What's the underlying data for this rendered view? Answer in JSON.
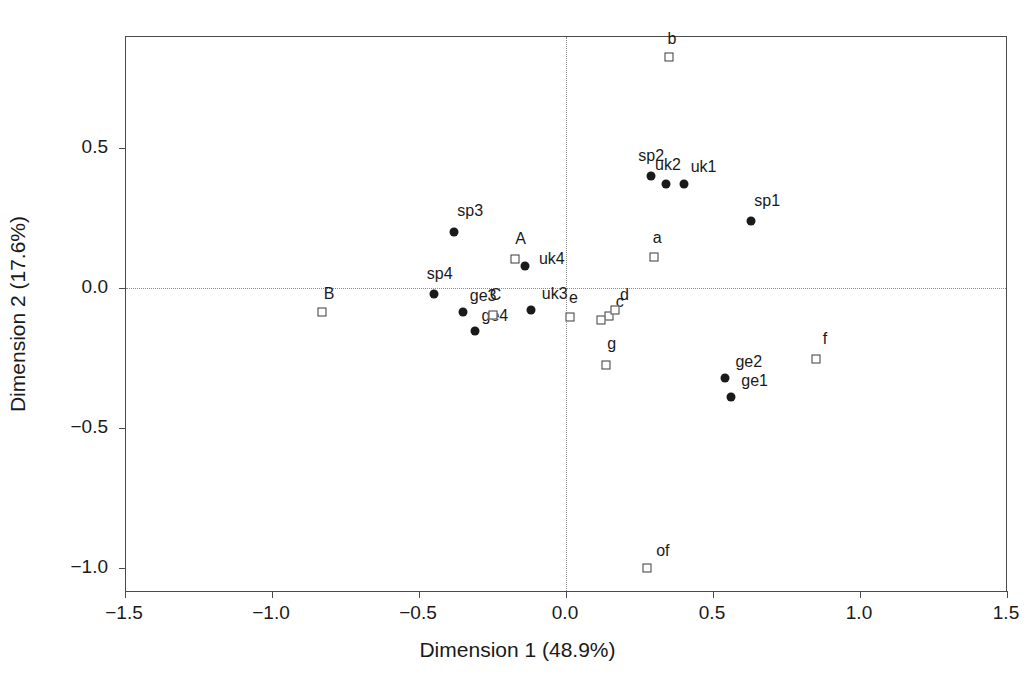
{
  "axes": {
    "xlabel": "Dimension 1 (48.9%)",
    "ylabel": "Dimension 2 (17.6%)",
    "x_ticks": [
      "-1.5",
      "-1.0",
      "-0.5",
      "0.0",
      "0.5",
      "1.0",
      "1.5"
    ],
    "y_ticks": [
      "0.5",
      "0.0",
      "-0.5",
      "-1.0"
    ]
  },
  "chart_data": {
    "type": "scatter",
    "title": "",
    "xlabel": "Dimension 1 (48.9%)",
    "ylabel": "Dimension 2 (17.6%)",
    "xlim": [
      -1.62,
      1.62
    ],
    "ylim": [
      -1.14,
      0.95
    ],
    "xticks": [
      -1.5,
      -1.0,
      -0.5,
      0.0,
      0.5,
      1.0,
      1.5
    ],
    "yticks": [
      0.5,
      0.0,
      -0.5,
      -1.0
    ],
    "grid": "dotted lines at x=0 and y=0",
    "legend": "none",
    "series": [
      {
        "name": "row-points",
        "marker": "filled-circle",
        "color": "#1a1a1a",
        "points": [
          {
            "label": "sp2",
            "x": 0.29,
            "y": 0.4,
            "label_dx": 0,
            "label_dy": -20
          },
          {
            "label": "uk2",
            "x": 0.34,
            "y": 0.37,
            "label_dx": 2,
            "label_dy": -19
          },
          {
            "label": "uk1",
            "x": 0.4,
            "y": 0.37,
            "label_dx": 20,
            "label_dy": -17
          },
          {
            "label": "sp1",
            "x": 0.63,
            "y": 0.24,
            "label_dx": 16,
            "label_dy": -20
          },
          {
            "label": "sp3",
            "x": -0.38,
            "y": 0.2,
            "label_dx": 16,
            "label_dy": -21
          },
          {
            "label": "uk4",
            "x": -0.14,
            "y": 0.08,
            "label_dx": 27,
            "label_dy": -7
          },
          {
            "label": "sp4",
            "x": -0.45,
            "y": -0.02,
            "label_dx": 6,
            "label_dy": -20
          },
          {
            "label": "ge3",
            "x": -0.35,
            "y": -0.085,
            "label_dx": 20,
            "label_dy": -16
          },
          {
            "label": "ge4",
            "x": -0.31,
            "y": -0.155,
            "label_dx": 20,
            "label_dy": -15
          },
          {
            "label": "uk3",
            "x": -0.12,
            "y": -0.08,
            "label_dx": 24,
            "label_dy": -16
          },
          {
            "label": "ge2",
            "x": 0.54,
            "y": -0.32,
            "label_dx": 24,
            "label_dy": -16
          },
          {
            "label": "ge1",
            "x": 0.56,
            "y": -0.39,
            "label_dx": 24,
            "label_dy": -16
          }
        ]
      },
      {
        "name": "column-points",
        "marker": "open-square",
        "color": "#3a3a3a",
        "points": [
          {
            "label": "b",
            "x": 0.35,
            "y": 0.825,
            "label_dx": 3,
            "label_dy": -18
          },
          {
            "label": "a",
            "x": 0.3,
            "y": 0.11,
            "label_dx": 3,
            "label_dy": -19
          },
          {
            "label": "A",
            "x": -0.175,
            "y": 0.105,
            "label_dx": 6,
            "label_dy": -20
          },
          {
            "label": "B",
            "x": -0.83,
            "y": -0.085,
            "label_dx": 7,
            "label_dy": -18
          },
          {
            "label": "C",
            "x": -0.25,
            "y": -0.095,
            "label_dx": 3,
            "label_dy": -20
          },
          {
            "label": "e",
            "x": 0.015,
            "y": -0.105,
            "label_dx": 3,
            "label_dy": -19
          },
          {
            "label": "c",
            "x": 0.145,
            "y": -0.1,
            "label_dx": 11,
            "label_dy": -14
          },
          {
            "label": "d",
            "x": 0.165,
            "y": -0.08,
            "label_dx": 10,
            "label_dy": -15
          },
          {
            "label": "",
            "x": 0.12,
            "y": -0.115,
            "label_dx": 0,
            "label_dy": 0
          },
          {
            "label": "g",
            "x": 0.135,
            "y": -0.275,
            "label_dx": 6,
            "label_dy": -21
          },
          {
            "label": "f",
            "x": 0.85,
            "y": -0.255,
            "label_dx": 9,
            "label_dy": -20
          },
          {
            "label": "of",
            "x": 0.275,
            "y": -1.0,
            "label_dx": 16,
            "label_dy": -17
          }
        ]
      }
    ]
  }
}
